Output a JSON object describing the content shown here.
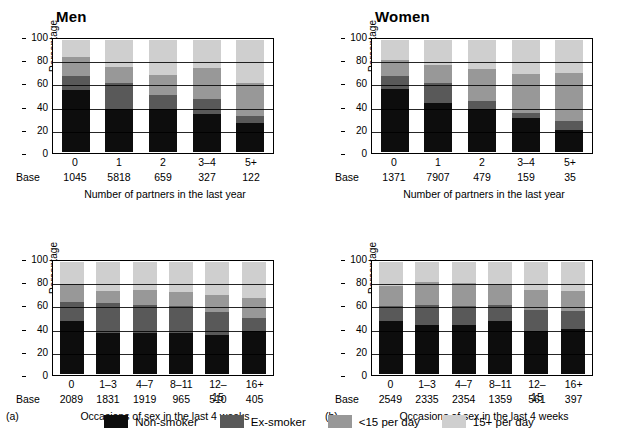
{
  "legend": {
    "items": [
      {
        "label": "Non-smoker",
        "color": "#0d0d0d"
      },
      {
        "label": "Ex-smoker",
        "color": "#595959"
      },
      {
        "label": "<15 per day",
        "color": "#989898"
      },
      {
        "label": "15+ per day",
        "color": "#cfcfcf"
      }
    ]
  },
  "common": {
    "ylabel": "Percentage",
    "base_word": "Base",
    "yticks": [
      "100",
      "80",
      "60",
      "40",
      "20",
      "0"
    ],
    "ylim": [
      0,
      100
    ]
  },
  "panels": [
    {
      "tag": "",
      "title": "Men",
      "xlabel": "Number of partners in the last year",
      "chart_data": {
        "type": "bar",
        "stacked": true,
        "title": "Men",
        "xlabel": "Number of partners in the last year",
        "ylabel": "Percentage",
        "ylim": [
          0,
          100
        ],
        "grid": true,
        "legend_position": "bottom-shared",
        "categories": [
          "0",
          "1",
          "2",
          "3-4",
          "5+"
        ],
        "base": [
          "1045",
          "5818",
          "659",
          "327",
          "122"
        ],
        "series": [
          {
            "name": "Non-smoker",
            "values": [
              55,
              38,
              38,
              34,
              26
            ]
          },
          {
            "name": "Ex-smoker",
            "values": [
              13,
              24,
              13,
              13,
              6
            ]
          },
          {
            "name": "<15 per day",
            "values": [
              17,
              14,
              18,
              28,
              30
            ]
          },
          {
            "name": "15+ per day",
            "values": [
              15,
              24,
              31,
              25,
              38
            ]
          }
        ]
      }
    },
    {
      "tag": "",
      "title": "Women",
      "xlabel": "Number of partners in the last year",
      "chart_data": {
        "type": "bar",
        "stacked": true,
        "title": "Women",
        "xlabel": "Number of partners in the last year",
        "ylabel": "Percentage",
        "ylim": [
          0,
          100
        ],
        "grid": true,
        "legend_position": "bottom-shared",
        "categories": [
          "0",
          "1",
          "2",
          "3-4",
          "5+"
        ],
        "base": [
          "1371",
          "7907",
          "479",
          "159",
          "35"
        ],
        "series": [
          {
            "name": "Non-smoker",
            "values": [
              56,
              44,
              38,
              30,
              20
            ]
          },
          {
            "name": "Ex-smoker",
            "values": [
              12,
              18,
              8,
              5,
              8
            ]
          },
          {
            "name": "<15 per day",
            "values": [
              14,
              16,
              28,
              35,
              43
            ]
          },
          {
            "name": "15+ per day",
            "values": [
              18,
              22,
              26,
              30,
              29
            ]
          }
        ]
      }
    },
    {
      "tag": "(a)",
      "title": "",
      "xlabel": "Occasions of sex in the last 4 weeks",
      "chart_data": {
        "type": "bar",
        "stacked": true,
        "title": "Men",
        "xlabel": "Occasions of sex in the last 4 weeks",
        "ylabel": "Percentage",
        "ylim": [
          0,
          100
        ],
        "grid": true,
        "legend_position": "bottom-shared",
        "categories": [
          "0",
          "1-3",
          "4-7",
          "8-11",
          "12-15",
          "16+"
        ],
        "base": [
          "2089",
          "1831",
          "1919",
          "965",
          "510",
          "405"
        ],
        "series": [
          {
            "name": "Non-smoker",
            "values": [
              47,
              37,
              37,
              37,
              35,
              38
            ]
          },
          {
            "name": "Ex-smoker",
            "values": [
              17,
              26,
              25,
              24,
              20,
              12
            ]
          },
          {
            "name": "<15 per day",
            "values": [
              16,
              11,
              13,
              12,
              16,
              18
            ]
          },
          {
            "name": "15+ per day",
            "values": [
              20,
              26,
              25,
              27,
              29,
              32
            ]
          }
        ]
      }
    },
    {
      "tag": "(b)",
      "title": "",
      "xlabel": "Occasions of sex in the last 4 weeks",
      "chart_data": {
        "type": "bar",
        "stacked": true,
        "title": "Women",
        "xlabel": "Occasions of sex in the last 4 weeks",
        "ylabel": "Percentage",
        "ylim": [
          0,
          100
        ],
        "grid": true,
        "legend_position": "bottom-shared",
        "categories": [
          "0",
          "1-3",
          "4-7",
          "8-11",
          "12-15",
          "16+"
        ],
        "base": [
          "2549",
          "2335",
          "2354",
          "1359",
          "561",
          "397"
        ],
        "series": [
          {
            "name": "Non-smoker",
            "values": [
              47,
              44,
              44,
              47,
              38,
              40
            ]
          },
          {
            "name": "Ex-smoker",
            "values": [
              14,
              18,
              17,
              15,
              19,
              16
            ]
          },
          {
            "name": "<15 per day",
            "values": [
              18,
              20,
              20,
              18,
              18,
              18
            ]
          },
          {
            "name": "15+ per day",
            "values": [
              21,
              18,
              19,
              20,
              25,
              26
            ]
          }
        ]
      }
    }
  ]
}
